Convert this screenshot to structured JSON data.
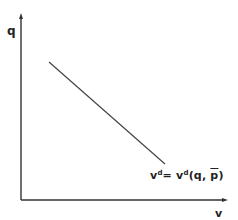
{
  "diagram": {
    "type": "demand-curve",
    "axes": {
      "y_label": "q",
      "x_label": "v"
    },
    "curve": {
      "label_lhs": "v",
      "label_lhs_sup": "d",
      "label_eq": "=",
      "label_rhs": "v",
      "label_rhs_sup": "d",
      "label_args_open": "(q, ",
      "label_arg_bar": "p",
      "label_args_close": ")",
      "full_label": "vd = vd(q, p̄)",
      "start": [
        49,
        62
      ],
      "end": [
        165,
        164
      ]
    },
    "colors": {
      "axis": "#333333",
      "line": "#444444",
      "text": "#222222"
    }
  }
}
